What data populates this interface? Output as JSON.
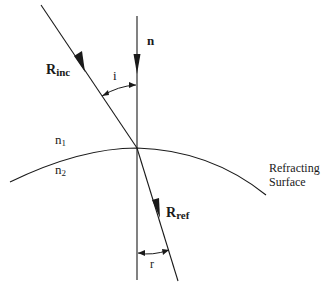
{
  "diagram": {
    "type": "refraction-geometry",
    "labels": {
      "normal": "n",
      "incident_ray_main": "R",
      "incident_ray_sub": "inc",
      "refracted_ray_main": "R",
      "refracted_ray_sub": "ref",
      "angle_incidence": "i",
      "angle_refraction": "r",
      "medium_1_main": "n",
      "medium_1_sub": "1",
      "medium_2_main": "n",
      "medium_2_sub": "2",
      "surface_line1": "Refracting",
      "surface_line2": "Surface"
    },
    "colors": {
      "stroke": "#1a1a1a",
      "background": "#ffffff"
    }
  }
}
